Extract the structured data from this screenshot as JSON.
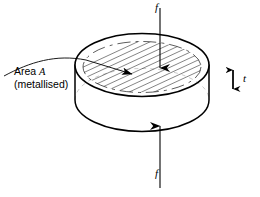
{
  "figure": {
    "type": "technical-line-diagram",
    "background_color": "#ffffff",
    "stroke_color": "#000000"
  },
  "labels": {
    "area": {
      "line1_prefix": "Area ",
      "line1_variable": "A",
      "line2": "(metallised)"
    },
    "force_top": "f",
    "force_bottom": "f",
    "thickness": "t"
  },
  "annotations": {
    "leader_line_name": "area-leader-line",
    "arrow_top_direction": "down",
    "arrow_bottom_direction": "up",
    "thickness_arrow_direction": "double-vertical"
  },
  "geometry": {
    "disc_center_x": 142,
    "disc_top_ellipse_cy": 65,
    "disc_bottom_ellipse_cy": 100,
    "disc_rx": 68,
    "disc_ry": 32,
    "metallised_inset_rx": 60,
    "metallised_inset_ry": 26,
    "hatch_count": 9
  }
}
